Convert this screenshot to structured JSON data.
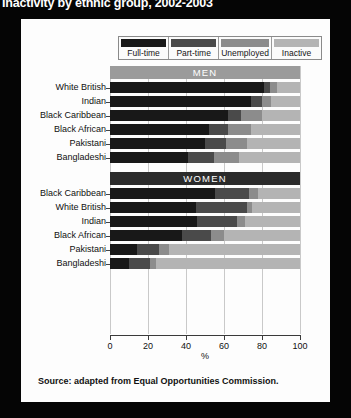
{
  "title": "Inactivity by ethnic group, 2002-2003",
  "source": "Source: adapted from Equal Opportunities Commission.",
  "legend": [
    {
      "label": "Full-time",
      "color": "#181818"
    },
    {
      "label": "Part-time",
      "color": "#4a4a4a"
    },
    {
      "label": "Unemployed",
      "color": "#8c8c8c"
    },
    {
      "label": "Inactive",
      "color": "#b4b4b4"
    }
  ],
  "groups": [
    {
      "name": "MEN"
    },
    {
      "name": "WOMEN"
    }
  ],
  "axis": {
    "ticks": [
      "0",
      "20",
      "40",
      "60",
      "80",
      "100"
    ],
    "xlabel": "%"
  },
  "chart_data": {
    "type": "bar",
    "title": "Inactivity by ethnic group, 2002-2003",
    "xlabel": "%",
    "ylabel": "",
    "xlim": [
      0,
      100
    ],
    "grid": true,
    "orientation": "horizontal",
    "stacked": true,
    "legend_position": "top",
    "series": [
      {
        "name": "Full-time",
        "color": "#181818"
      },
      {
        "name": "Part-time",
        "color": "#4a4a4a"
      },
      {
        "name": "Unemployed",
        "color": "#8c8c8c"
      },
      {
        "name": "Inactive",
        "color": "#b4b4b4"
      }
    ],
    "groups": [
      {
        "name": "MEN",
        "categories": [
          "White British",
          "Indian",
          "Black Caribbean",
          "Black African",
          "Pakistani",
          "Bangladeshi"
        ],
        "values": [
          [
            81,
            3,
            4,
            12
          ],
          [
            74,
            6,
            5,
            15
          ],
          [
            62,
            7,
            11,
            20
          ],
          [
            52,
            10,
            12,
            26
          ],
          [
            50,
            11,
            11,
            28
          ],
          [
            41,
            14,
            13,
            32
          ]
        ]
      },
      {
        "name": "WOMEN",
        "categories": [
          "Black Caribbean",
          "White British",
          "Indian",
          "Black African",
          "Pakistani",
          "Bangladeshi"
        ],
        "values": [
          [
            55,
            18,
            5,
            22
          ],
          [
            45,
            27,
            3,
            25
          ],
          [
            46,
            21,
            4,
            29
          ],
          [
            38,
            15,
            7,
            40
          ],
          [
            14,
            12,
            5,
            69
          ],
          [
            10,
            11,
            3,
            76
          ]
        ]
      }
    ]
  }
}
